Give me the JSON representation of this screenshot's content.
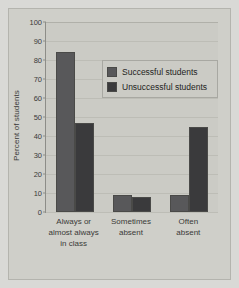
{
  "chart_data": {
    "type": "bar",
    "title": "",
    "xlabel": "",
    "ylabel": "Percent of students",
    "ylim": [
      0,
      100
    ],
    "yticks": [
      0,
      10,
      20,
      30,
      40,
      50,
      60,
      70,
      80,
      90,
      100
    ],
    "grid": true,
    "legend_position": "inside-top-right",
    "categories": [
      "Always or almost always in class",
      "Sometimes absent",
      "Often absent"
    ],
    "category_lines": [
      [
        "Always or",
        "almost always",
        "in class"
      ],
      [
        "Sometimes",
        "absent"
      ],
      [
        "Often",
        "absent"
      ]
    ],
    "series": [
      {
        "name": "Successful students",
        "color": "#58585a",
        "values": [
          84,
          9,
          9
        ]
      },
      {
        "name": "Unsuccessful students",
        "color": "#3a3a3c",
        "values": [
          47,
          8,
          45
        ]
      }
    ]
  },
  "legend": {
    "items": [
      {
        "label": "Successful students"
      },
      {
        "label": "Unsuccessful students"
      }
    ]
  },
  "axis": {
    "y_title": "Percent of students",
    "tick_labels": [
      "0",
      "10",
      "20",
      "30",
      "40",
      "50",
      "60",
      "70",
      "80",
      "90",
      "100"
    ]
  },
  "colors": {
    "page_background": "#d9d9d6",
    "panel_background": "#cfcfc9",
    "plot_background": "#cbcbc5",
    "gridline": "#bdbdb6",
    "axis_line": "#8d8d88",
    "text": "#3a3a38",
    "series1": "#58585a",
    "series2": "#3a3a3c"
  }
}
